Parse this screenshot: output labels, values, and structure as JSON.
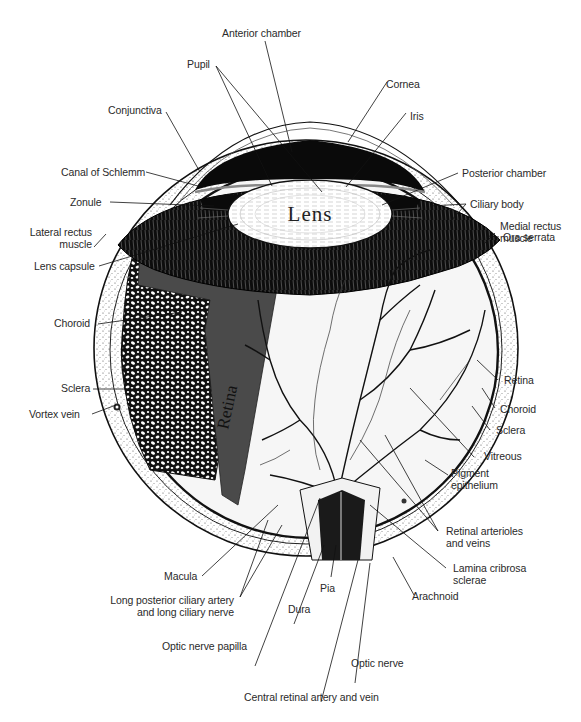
{
  "figure": {
    "inline_labels": {
      "lens": "Lens",
      "retina": "Retina"
    },
    "colors": {
      "background": "#ffffff",
      "ink": "#111111",
      "retina_band": "#4a4a4a",
      "label_text": "#2a2a2a"
    }
  },
  "labels": {
    "anterior_chamber": "Anterior chamber",
    "pupil": "Pupil",
    "cornea": "Cornea",
    "conjunctiva": "Conjunctiva",
    "iris": "Iris",
    "canal_of_schlemm": "Canal of Schlemm",
    "posterior_chamber": "Posterior chamber",
    "ciliary_body": "Ciliary body",
    "zonule": "Zonule",
    "medial_rectus_muscle_1": "Medial rectus",
    "medial_rectus_muscle_2": "muscle",
    "lateral_rectus_muscle_1": "Lateral rectus",
    "lateral_rectus_muscle_2": "muscle",
    "ora_serrata": "Ora serrata",
    "lens_capsule": "Lens capsule",
    "choroid_left": "Choroid",
    "retina_right": "Retina",
    "choroid_right": "Choroid",
    "sclera_left": "Sclera",
    "sclera_right": "Sclera",
    "vortex_vein": "Vortex vein",
    "vitreous": "Vitreous",
    "pigment_epithelium_1": "Pigment",
    "pigment_epithelium_2": "epithelium",
    "retinal_arterioles_1": "Retinal arterioles",
    "retinal_arterioles_2": "and veins",
    "lamina_cribrosa_1": "Lamina cribrosa",
    "lamina_cribrosa_2": "sclerae",
    "macula": "Macula",
    "pia": "Pia",
    "arachnoid": "Arachnoid",
    "long_posterior_ciliary_1": "Long posterior ciliary artery",
    "long_posterior_ciliary_2": "and long ciliary nerve",
    "dura": "Dura",
    "optic_nerve_papilla": "Optic nerve papilla",
    "optic_nerve": "Optic nerve",
    "central_retinal_artery": "Central retinal artery and vein"
  }
}
